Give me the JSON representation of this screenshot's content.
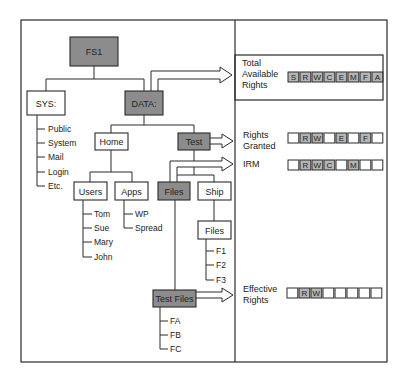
{
  "colors": {
    "line": "#2a2a2a",
    "shaded": "#8c8c8c",
    "cell_shaded": "#b4b4b4",
    "background": "#ffffff"
  },
  "tree": {
    "root": {
      "label": "FS1",
      "shaded": true
    },
    "sys": {
      "label": "SYS:",
      "shaded": false,
      "children": [
        "Public",
        "System",
        "Mail",
        "Login",
        "Etc."
      ]
    },
    "data": {
      "label": "DATA:",
      "shaded": true
    },
    "home": {
      "label": "Home",
      "shaded": false
    },
    "test": {
      "label": "Test",
      "shaded": true
    },
    "users": {
      "label": "Users",
      "shaded": false,
      "children": [
        "Tom",
        "Sue",
        "Mary",
        "John"
      ]
    },
    "apps": {
      "label": "Apps",
      "shaded": false,
      "children": [
        "WP",
        "Spread"
      ]
    },
    "files": {
      "label": "Files",
      "shaded": true
    },
    "ship": {
      "label": "Ship",
      "shaded": false
    },
    "ship_files": {
      "label": "Files",
      "shaded": false,
      "children": [
        "F1",
        "F2",
        "F3"
      ]
    },
    "test_files": {
      "label": "Test Files",
      "shaded": true,
      "children": [
        "FA",
        "FB",
        "FC"
      ]
    }
  },
  "rights_panel": {
    "total_available": {
      "label_lines": [
        "Total",
        "Available",
        "Rights"
      ],
      "cells": [
        {
          "letter": "S",
          "shaded": true
        },
        {
          "letter": "R",
          "shaded": true
        },
        {
          "letter": "W",
          "shaded": true
        },
        {
          "letter": "C",
          "shaded": true
        },
        {
          "letter": "E",
          "shaded": true
        },
        {
          "letter": "M",
          "shaded": true
        },
        {
          "letter": "F",
          "shaded": true
        },
        {
          "letter": "A",
          "shaded": true
        }
      ]
    },
    "rights_granted": {
      "label_lines": [
        "Rights",
        "Granted"
      ],
      "cells": [
        {
          "letter": "",
          "shaded": false
        },
        {
          "letter": "R",
          "shaded": true
        },
        {
          "letter": "W",
          "shaded": true
        },
        {
          "letter": "",
          "shaded": false
        },
        {
          "letter": "E",
          "shaded": true
        },
        {
          "letter": "",
          "shaded": false
        },
        {
          "letter": "F",
          "shaded": true
        },
        {
          "letter": "",
          "shaded": false
        }
      ]
    },
    "irm": {
      "label_lines": [
        "IRM"
      ],
      "cells": [
        {
          "letter": "",
          "shaded": false
        },
        {
          "letter": "R",
          "shaded": true
        },
        {
          "letter": "W",
          "shaded": true
        },
        {
          "letter": "C",
          "shaded": true
        },
        {
          "letter": "",
          "shaded": false
        },
        {
          "letter": "M",
          "shaded": true
        },
        {
          "letter": "",
          "shaded": false
        },
        {
          "letter": "",
          "shaded": false
        }
      ]
    },
    "effective_rights": {
      "label_lines": [
        "Effective",
        "Rights"
      ],
      "cells": [
        {
          "letter": "",
          "shaded": false
        },
        {
          "letter": "R",
          "shaded": true
        },
        {
          "letter": "W",
          "shaded": true
        },
        {
          "letter": "",
          "shaded": false
        },
        {
          "letter": "",
          "shaded": false
        },
        {
          "letter": "",
          "shaded": false
        },
        {
          "letter": "",
          "shaded": false
        },
        {
          "letter": "",
          "shaded": false
        }
      ]
    }
  }
}
